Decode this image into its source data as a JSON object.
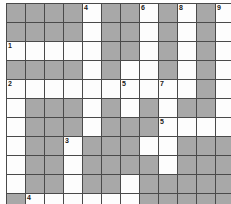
{
  "puzzle": {
    "title": "Crossword Grid",
    "columns": 12,
    "rows": 11,
    "cell_size": 19,
    "colors": {
      "filled": "#a8a8a8",
      "open": "#fdfdfd",
      "grid_line": "#4a4a4a",
      "number_text": "#1a1a1a",
      "page_background": "#ffffff"
    },
    "legend": {
      "filled_label": "blocked square",
      "open_label": "letter square"
    },
    "cells": [
      [
        {
          "state": "filled",
          "number": ""
        },
        {
          "state": "filled",
          "number": ""
        },
        {
          "state": "filled",
          "number": ""
        },
        {
          "state": "filled",
          "number": ""
        },
        {
          "state": "open",
          "number": "4"
        },
        {
          "state": "filled",
          "number": ""
        },
        {
          "state": "filled",
          "number": ""
        },
        {
          "state": "open",
          "number": "6"
        },
        {
          "state": "filled",
          "number": ""
        },
        {
          "state": "open",
          "number": "8"
        },
        {
          "state": "filled",
          "number": ""
        },
        {
          "state": "open",
          "number": "9"
        }
      ],
      [
        {
          "state": "filled",
          "number": ""
        },
        {
          "state": "filled",
          "number": ""
        },
        {
          "state": "filled",
          "number": ""
        },
        {
          "state": "filled",
          "number": ""
        },
        {
          "state": "open",
          "number": ""
        },
        {
          "state": "filled",
          "number": ""
        },
        {
          "state": "filled",
          "number": ""
        },
        {
          "state": "open",
          "number": ""
        },
        {
          "state": "filled",
          "number": ""
        },
        {
          "state": "open",
          "number": ""
        },
        {
          "state": "filled",
          "number": ""
        },
        {
          "state": "open",
          "number": ""
        }
      ],
      [
        {
          "state": "open",
          "number": "1"
        },
        {
          "state": "open",
          "number": ""
        },
        {
          "state": "open",
          "number": ""
        },
        {
          "state": "open",
          "number": ""
        },
        {
          "state": "open",
          "number": ""
        },
        {
          "state": "filled",
          "number": ""
        },
        {
          "state": "filled",
          "number": ""
        },
        {
          "state": "open",
          "number": ""
        },
        {
          "state": "filled",
          "number": ""
        },
        {
          "state": "open",
          "number": ""
        },
        {
          "state": "filled",
          "number": ""
        },
        {
          "state": "open",
          "number": ""
        }
      ],
      [
        {
          "state": "filled",
          "number": ""
        },
        {
          "state": "filled",
          "number": ""
        },
        {
          "state": "filled",
          "number": ""
        },
        {
          "state": "filled",
          "number": ""
        },
        {
          "state": "open",
          "number": ""
        },
        {
          "state": "filled",
          "number": ""
        },
        {
          "state": "open",
          "number": ""
        },
        {
          "state": "open",
          "number": ""
        },
        {
          "state": "filled",
          "number": ""
        },
        {
          "state": "open",
          "number": ""
        },
        {
          "state": "filled",
          "number": ""
        },
        {
          "state": "open",
          "number": ""
        }
      ],
      [
        {
          "state": "open",
          "number": "2"
        },
        {
          "state": "open",
          "number": ""
        },
        {
          "state": "open",
          "number": ""
        },
        {
          "state": "open",
          "number": ""
        },
        {
          "state": "open",
          "number": ""
        },
        {
          "state": "open",
          "number": ""
        },
        {
          "state": "open",
          "number": "5"
        },
        {
          "state": "open",
          "number": ""
        },
        {
          "state": "open",
          "number": "7"
        },
        {
          "state": "open",
          "number": ""
        },
        {
          "state": "filled",
          "number": ""
        },
        {
          "state": "open",
          "number": ""
        }
      ],
      [
        {
          "state": "open",
          "number": ""
        },
        {
          "state": "filled",
          "number": ""
        },
        {
          "state": "filled",
          "number": ""
        },
        {
          "state": "filled",
          "number": ""
        },
        {
          "state": "open",
          "number": ""
        },
        {
          "state": "filled",
          "number": ""
        },
        {
          "state": "open",
          "number": ""
        },
        {
          "state": "filled",
          "number": ""
        },
        {
          "state": "open",
          "number": ""
        },
        {
          "state": "filled",
          "number": ""
        },
        {
          "state": "filled",
          "number": ""
        },
        {
          "state": "open",
          "number": ""
        }
      ],
      [
        {
          "state": "open",
          "number": ""
        },
        {
          "state": "filled",
          "number": ""
        },
        {
          "state": "filled",
          "number": ""
        },
        {
          "state": "filled",
          "number": ""
        },
        {
          "state": "open",
          "number": ""
        },
        {
          "state": "filled",
          "number": ""
        },
        {
          "state": "filled",
          "number": ""
        },
        {
          "state": "filled",
          "number": ""
        },
        {
          "state": "open",
          "number": "5"
        },
        {
          "state": "open",
          "number": ""
        },
        {
          "state": "open",
          "number": ""
        },
        {
          "state": "open",
          "number": ""
        }
      ],
      [
        {
          "state": "open",
          "number": ""
        },
        {
          "state": "filled",
          "number": ""
        },
        {
          "state": "filled",
          "number": ""
        },
        {
          "state": "open",
          "number": "3"
        },
        {
          "state": "filled",
          "number": ""
        },
        {
          "state": "filled",
          "number": ""
        },
        {
          "state": "filled",
          "number": ""
        },
        {
          "state": "open",
          "number": ""
        },
        {
          "state": "open",
          "number": ""
        },
        {
          "state": "filled",
          "number": ""
        },
        {
          "state": "filled",
          "number": ""
        },
        {
          "state": "filled",
          "number": ""
        }
      ],
      [
        {
          "state": "open",
          "number": ""
        },
        {
          "state": "filled",
          "number": ""
        },
        {
          "state": "filled",
          "number": ""
        },
        {
          "state": "open",
          "number": ""
        },
        {
          "state": "filled",
          "number": ""
        },
        {
          "state": "filled",
          "number": ""
        },
        {
          "state": "filled",
          "number": ""
        },
        {
          "state": "filled",
          "number": ""
        },
        {
          "state": "open",
          "number": ""
        },
        {
          "state": "filled",
          "number": ""
        },
        {
          "state": "filled",
          "number": ""
        },
        {
          "state": "filled",
          "number": ""
        }
      ],
      [
        {
          "state": "open",
          "number": ""
        },
        {
          "state": "filled",
          "number": ""
        },
        {
          "state": "filled",
          "number": ""
        },
        {
          "state": "open",
          "number": ""
        },
        {
          "state": "filled",
          "number": ""
        },
        {
          "state": "filled",
          "number": ""
        },
        {
          "state": "open",
          "number": ""
        },
        {
          "state": "filled",
          "number": ""
        },
        {
          "state": "filled",
          "number": ""
        },
        {
          "state": "filled",
          "number": ""
        },
        {
          "state": "filled",
          "number": ""
        },
        {
          "state": "filled",
          "number": ""
        }
      ],
      [
        {
          "state": "filled",
          "number": ""
        },
        {
          "state": "open",
          "number": "4"
        },
        {
          "state": "open",
          "number": ""
        },
        {
          "state": "open",
          "number": ""
        },
        {
          "state": "open",
          "number": ""
        },
        {
          "state": "open",
          "number": ""
        },
        {
          "state": "open",
          "number": ""
        },
        {
          "state": "filled",
          "number": ""
        },
        {
          "state": "filled",
          "number": ""
        },
        {
          "state": "filled",
          "number": ""
        },
        {
          "state": "filled",
          "number": ""
        },
        {
          "state": "filled",
          "number": ""
        }
      ]
    ]
  }
}
